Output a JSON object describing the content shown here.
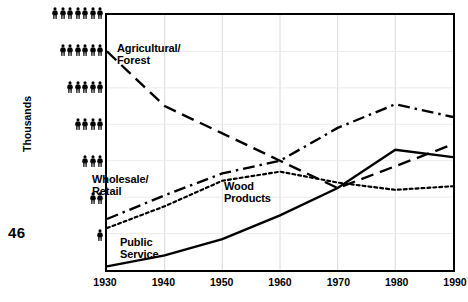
{
  "folio": "46",
  "axes": {
    "ylabel": "Thousands",
    "y_unit_icon": "person-pictogram",
    "y_ticks": [
      {
        "value": 7,
        "count": 7
      },
      {
        "value": 6,
        "count": 6
      },
      {
        "value": 5,
        "count": 5
      },
      {
        "value": 4,
        "count": 4
      },
      {
        "value": 3,
        "count": 3
      },
      {
        "value": 2,
        "count": 2
      },
      {
        "value": 1,
        "count": 1
      }
    ],
    "x_ticks": [
      "1930",
      "1940",
      "1950",
      "1960",
      "1970",
      "1980",
      "1990"
    ]
  },
  "labels": {
    "agricultural": "Agricultural/\nForest",
    "wholesale": "Wholesale/\nRetail",
    "wood": "Wood\nProducts",
    "public": "Public\nService"
  },
  "chart_data": {
    "type": "line",
    "title": "",
    "xlabel": "",
    "ylabel": "Thousands",
    "x": [
      1930,
      1940,
      1950,
      1960,
      1970,
      1980,
      1990
    ],
    "xlim": [
      1930,
      1990
    ],
    "ylim": [
      0.0,
      7.0
    ],
    "grid": true,
    "legend": "inline-annotations",
    "y_tick_values": [
      1,
      2,
      3,
      4,
      5,
      6,
      7
    ],
    "series": [
      {
        "name": "Agricultural/Forest",
        "style": "long-dash",
        "color": "#000000",
        "values": [
          6.0,
          4.5,
          3.75,
          3.0,
          2.25,
          2.85,
          3.45
        ]
      },
      {
        "name": "Wholesale/Retail",
        "style": "dash-dot",
        "color": "#000000",
        "values": [
          1.4,
          2.05,
          2.65,
          3.0,
          3.9,
          4.55,
          4.2
        ]
      },
      {
        "name": "Wood Products",
        "style": "dotted",
        "color": "#000000",
        "values": [
          1.15,
          1.75,
          2.45,
          2.7,
          2.4,
          2.2,
          2.3
        ]
      },
      {
        "name": "Public Service",
        "style": "solid",
        "color": "#000000",
        "values": [
          0.1,
          0.4,
          0.85,
          1.5,
          2.25,
          3.3,
          3.1
        ]
      }
    ]
  }
}
